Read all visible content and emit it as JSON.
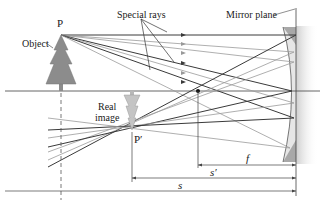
{
  "diagram": {
    "labels": {
      "object_point": "P",
      "object": "Object",
      "special_rays": "Special rays",
      "mirror_plane": "Mirror plane",
      "real_image": "Real",
      "real_image_line2": "image",
      "image_point": "P′",
      "focal_length": "f",
      "image_distance": "s′",
      "object_distance": "s"
    },
    "colors": {
      "ray_dark": "#3a3a3a",
      "ray_light": "#9a9a9a",
      "tree_fill": "#8c8c8c",
      "mirror_fill": "#a8a8a8",
      "axis": "#555555"
    },
    "geometry": {
      "optical_axis_y": 91,
      "object_x": 61,
      "object_tip_y": 35,
      "image_x": 132,
      "image_tip_y": 130,
      "focal_x": 198,
      "mirror_x": 296
    }
  }
}
